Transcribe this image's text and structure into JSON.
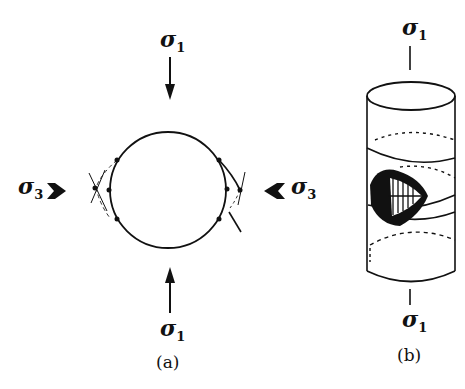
{
  "figure": {
    "panel_a": {
      "caption": "(a)",
      "labels": {
        "top": {
          "symbol": "σ",
          "subscript": "1"
        },
        "bottom": {
          "symbol": "σ",
          "subscript": "1"
        },
        "left": {
          "symbol": "σ",
          "subscript": "3"
        },
        "right": {
          "symbol": "σ",
          "subscript": "3"
        }
      },
      "description": "Circular cross-section compressed by σ1 vertically and σ3 horizontally, with conjugate shear fractures at the flanks"
    },
    "panel_b": {
      "caption": "(b)",
      "labels": {
        "top": {
          "symbol": "σ",
          "subscript": "1"
        },
        "bottom": {
          "symbol": "σ",
          "subscript": "1"
        }
      },
      "description": "Cylindrical specimen with dashed cross-sections and a conical fracture surface showing plumose markings"
    },
    "colors": {
      "ink": "#111111",
      "background": "#ffffff"
    }
  }
}
